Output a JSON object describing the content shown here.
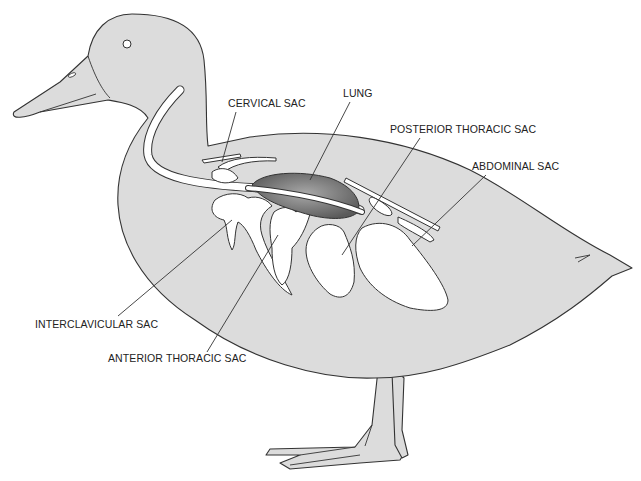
{
  "figure": {
    "colors": {
      "body_fill": "#dcdcdc",
      "sac_fill": "#ffffff",
      "lung_fill": "#8a8a8a",
      "outline": "#333333",
      "label_text": "#222222"
    }
  },
  "labels": [
    {
      "id": "cervical",
      "text": "CERVICAL SAC",
      "x": 228,
      "y": 107
    },
    {
      "id": "lung",
      "text": "LUNG",
      "x": 343,
      "y": 97
    },
    {
      "id": "posterior_thoracic",
      "text": "POSTERIOR THORACIC SAC",
      "x": 390,
      "y": 133
    },
    {
      "id": "abdominal",
      "text": "ABDOMINAL SAC",
      "x": 472,
      "y": 170
    },
    {
      "id": "interclavicular",
      "text": "INTERCLAVICULAR SAC",
      "x": 35,
      "y": 328
    },
    {
      "id": "anterior_thoracic",
      "text": "ANTERIOR THORACIC SAC",
      "x": 108,
      "y": 362
    }
  ]
}
